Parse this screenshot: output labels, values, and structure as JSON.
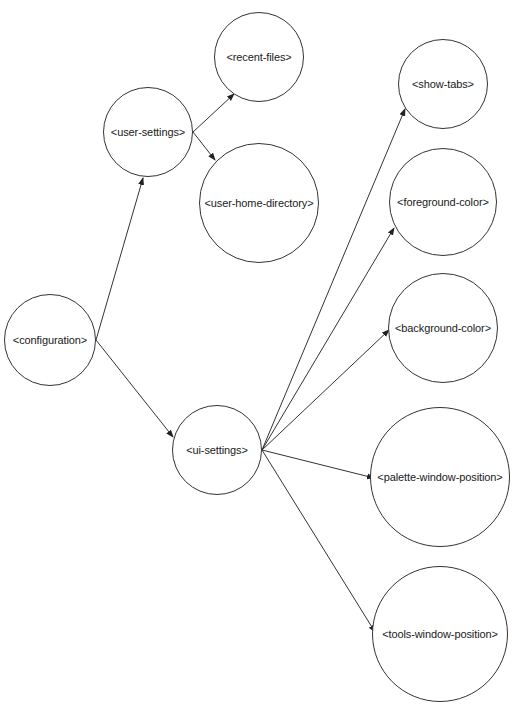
{
  "diagram": {
    "type": "tree",
    "nodes": [
      {
        "id": "configuration",
        "label": "<configuration>",
        "cx": 50,
        "cy": 340,
        "r": 46
      },
      {
        "id": "user-settings",
        "label": "<user-settings>",
        "cx": 148,
        "cy": 132,
        "r": 45
      },
      {
        "id": "recent-files",
        "label": "<recent-files>",
        "cx": 259,
        "cy": 57,
        "r": 45
      },
      {
        "id": "user-home-directory",
        "label": "<user-home-directory>",
        "cx": 259,
        "cy": 203,
        "r": 60
      },
      {
        "id": "ui-settings",
        "label": "<ui-settings>",
        "cx": 217,
        "cy": 450,
        "r": 45
      },
      {
        "id": "show-tabs",
        "label": "<show-tabs>",
        "cx": 443,
        "cy": 84,
        "r": 45
      },
      {
        "id": "foreground-color",
        "label": "<foreground-color>",
        "cx": 443,
        "cy": 202,
        "r": 54
      },
      {
        "id": "background-color",
        "label": "<background-color>",
        "cx": 443,
        "cy": 328,
        "r": 55
      },
      {
        "id": "palette-window-position",
        "label": "<palette-window-position>",
        "cx": 440,
        "cy": 477,
        "r": 70
      },
      {
        "id": "tools-window-position",
        "label": "<tools-window-position>",
        "cx": 440,
        "cy": 634,
        "r": 68
      }
    ],
    "edges": [
      {
        "from": "configuration",
        "to": "user-settings",
        "x1": 96,
        "y1": 340,
        "x2": 143,
        "y2": 178
      },
      {
        "from": "configuration",
        "to": "ui-settings",
        "x1": 96,
        "y1": 340,
        "x2": 173,
        "y2": 437
      },
      {
        "from": "user-settings",
        "to": "recent-files",
        "x1": 193,
        "y1": 132,
        "x2": 234,
        "y2": 94
      },
      {
        "from": "user-settings",
        "to": "user-home-directory",
        "x1": 193,
        "y1": 132,
        "x2": 215,
        "y2": 160
      },
      {
        "from": "ui-settings",
        "to": "show-tabs",
        "x1": 262,
        "y1": 450,
        "x2": 405,
        "y2": 109
      },
      {
        "from": "ui-settings",
        "to": "foreground-color",
        "x1": 262,
        "y1": 450,
        "x2": 394,
        "y2": 228
      },
      {
        "from": "ui-settings",
        "to": "background-color",
        "x1": 262,
        "y1": 450,
        "x2": 389,
        "y2": 330
      },
      {
        "from": "ui-settings",
        "to": "palette-window-position",
        "x1": 262,
        "y1": 450,
        "x2": 374,
        "y2": 478
      },
      {
        "from": "ui-settings",
        "to": "tools-window-position",
        "x1": 262,
        "y1": 450,
        "x2": 375,
        "y2": 632
      }
    ],
    "colors": {
      "stroke": "#333333",
      "fill": "#ffffff",
      "text": "#1a1a1a"
    }
  }
}
